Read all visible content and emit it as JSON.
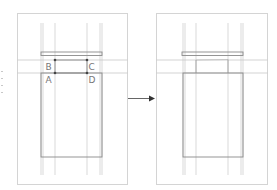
{
  "diagram": {
    "before_panel": {
      "points": [
        {
          "id": "B",
          "label": "B"
        },
        {
          "id": "C",
          "label": "C"
        },
        {
          "id": "A",
          "label": "A"
        },
        {
          "id": "D",
          "label": "D"
        }
      ]
    },
    "after_panel": {
      "points": []
    },
    "arrow": {
      "direction": "right",
      "meaning": "transforms-to"
    },
    "colors": {
      "frame": "#d4d4d4",
      "guide": "#cfcfcf",
      "shape": "#8a8a8a",
      "point": "#444444",
      "label": "#777777",
      "arrow": "#333333"
    }
  }
}
